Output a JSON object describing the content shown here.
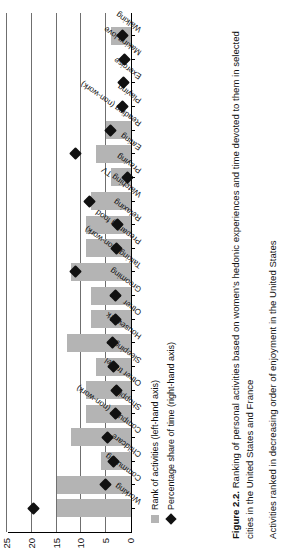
{
  "figure": {
    "label": "Figure 2.2.",
    "title": "Ranking of personal activities based on women's hedonic experiences and time devoted to them in selected cities in the United States and France",
    "note": "Activities ranked in decreasing order of enjoyment in the United States"
  },
  "legend": {
    "items": [
      {
        "marker": "square-swatch",
        "label": "Rank of activities (left-hand axis)"
      },
      {
        "marker": "diamond-swatch",
        "label": "Percentage share of time (right-hand axis)"
      }
    ]
  },
  "chart_data": {
    "type": "bar",
    "title": "Ranking of personal activities based on women's hedonic experiences and time devoted to them in selected cities in the United States and France",
    "xlabel": "",
    "ylabel": "Rank of activities",
    "y2label": "Percentage share of time",
    "ylim": [
      0,
      25
    ],
    "y2lim": [
      0.0,
      0.4
    ],
    "yticks": [
      0,
      5,
      10,
      15,
      20,
      25
    ],
    "y2ticks": [
      0.0,
      0.1,
      0.2,
      0.3,
      0.4
    ],
    "grid": true,
    "legend_position": "bottom-left",
    "categories": [
      "Working",
      "Commuting",
      "Childcare",
      "Computer (non-work)",
      "Shopping",
      "Other travel",
      "Sleeping",
      "Housework",
      "Other",
      "Grooming",
      "Talking (non-work)",
      "Preparing food",
      "Relaxing",
      "Watching TV",
      "Praying",
      "Eating",
      "Reading (non-work)",
      "Playing",
      "Exercise",
      "Making love",
      "Walking"
    ],
    "series": [
      {
        "name": "Rank of activities (left-hand axis)",
        "axis": "left",
        "type": "bar",
        "color": "#b4b4b4",
        "values": [
          15,
          15,
          6,
          12,
          9,
          9,
          7,
          13,
          8,
          8,
          12,
          9,
          9,
          8,
          4,
          7,
          5,
          0,
          0,
          0,
          4
        ]
      },
      {
        "name": "Percentage share of time (right-hand axis)",
        "axis": "right",
        "type": "scatter",
        "marker": "diamond",
        "color": "#111111",
        "values": [
          0.315,
          0.082,
          0.055,
          0.077,
          0.049,
          0.048,
          0.057,
          0.06,
          0.05,
          0.051,
          0.18,
          0.046,
          0.042,
          0.135,
          0.01,
          0.178,
          0.065,
          0.026,
          0.025,
          0.022,
          0.028
        ]
      }
    ]
  },
  "axes": {
    "left_axis_name": "Rank of activities (left-hand axis)",
    "right_axis_name": "Percentage share of time (right-hand axis)"
  }
}
